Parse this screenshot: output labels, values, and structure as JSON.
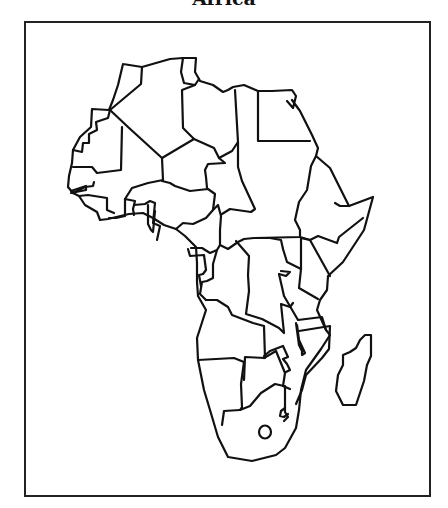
{
  "map": {
    "title": "Africa",
    "style": {
      "stroke": "#111111",
      "background": "#ffffff",
      "frame": "#222222"
    },
    "description": "Blank outline political map of Africa with country borders and Madagascar"
  }
}
